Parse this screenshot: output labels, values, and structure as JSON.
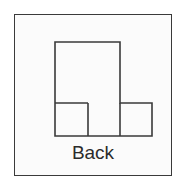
{
  "figure": {
    "title": "Back",
    "caption": "Back",
    "background_color": "#ffffff",
    "panel_fill": "#fbfbfb",
    "line_color": "#3a3a3a",
    "text_color": "#2b2b2b",
    "line_width": 1.6,
    "panel": {
      "label": "figure-frame",
      "x": 14,
      "y": 14,
      "width": 158,
      "height": 162
    },
    "shapes": [
      {
        "name": "tall-rectangle",
        "role": "vertical-column",
        "x": 55,
        "y": 42,
        "width": 65,
        "height": 94
      },
      {
        "name": "left-small-square",
        "role": "left-foot",
        "x": 55,
        "y": 103,
        "width": 33,
        "height": 33
      },
      {
        "name": "right-small-square",
        "role": "right-foot",
        "x": 120,
        "y": 103,
        "width": 32,
        "height": 33
      }
    ],
    "outline_path": "M55,42 L120,42 L120,103 L152,103 L152,136 L55,136 Z",
    "internal_lines": [
      {
        "name": "left-foot-top-divider",
        "x1": 55,
        "y1": 103,
        "x2": 88,
        "y2": 103
      },
      {
        "name": "left-foot-right-divider",
        "x1": 88,
        "y1": 103,
        "x2": 88,
        "y2": 136
      },
      {
        "name": "column-right-divider",
        "x1": 120,
        "y1": 103,
        "x2": 120,
        "y2": 136
      }
    ]
  }
}
